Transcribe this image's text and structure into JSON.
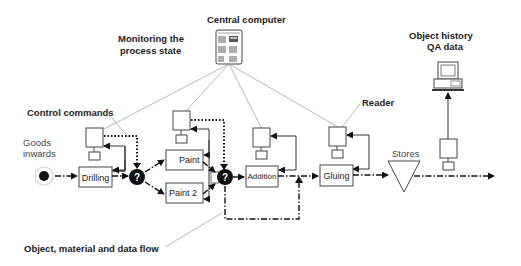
{
  "labels": {
    "central_computer": "Central computer",
    "monitoring_1": "Monitoring the",
    "monitoring_2": "process state",
    "object_history": "Object history",
    "qa_data": "QA data",
    "control_commands": "Control commands",
    "reader": "Reader",
    "goods_1": "Goods",
    "goods_2": "inwards",
    "flow_label": "Object, material and data flow",
    "stores": "Stores"
  },
  "nodes": {
    "drilling": "Drilling",
    "paint": "Paint",
    "paint2": "Paint 2",
    "addition": "Addition",
    "gluing": "Gluing",
    "decision": "?"
  }
}
